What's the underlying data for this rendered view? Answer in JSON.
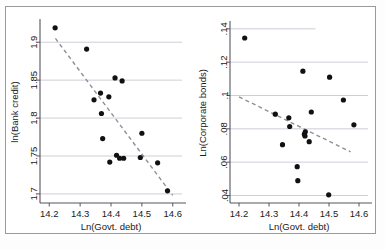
{
  "figure": {
    "background": "#ffffff",
    "frame_color": "#9a9a9a",
    "point_color": "#111111",
    "fitline_color": "#8f8f97",
    "grid_color": "#b9b9c6"
  },
  "chart_data": [
    {
      "type": "scatter",
      "title": "",
      "panel": "left",
      "xlabel": "Ln(Govt. debt)",
      "ylabel": "ln(Bank credit)",
      "xlim": [
        14.17,
        14.63
      ],
      "ylim": [
        1.688,
        1.928
      ],
      "xticks": [
        "14.2",
        "14.3",
        "14.4",
        "14.5",
        "14.6"
      ],
      "xtick_values": [
        14.2,
        14.3,
        14.4,
        14.5,
        14.6
      ],
      "yticks": [
        "1.9",
        "1.85",
        "1.8",
        "1.75",
        "1.7"
      ],
      "ytick_values": [
        1.9,
        1.85,
        1.8,
        1.75,
        1.7
      ],
      "grid": true,
      "legend": "none",
      "x": [
        14.219,
        14.321,
        14.345,
        14.366,
        14.369,
        14.373,
        14.393,
        14.396,
        14.413,
        14.418,
        14.428,
        14.436,
        14.441,
        14.495,
        14.5,
        14.551,
        14.583
      ],
      "y": [
        1.919,
        1.891,
        1.824,
        1.833,
        1.806,
        1.773,
        1.828,
        1.742,
        1.853,
        1.751,
        1.747,
        1.849,
        1.747,
        1.748,
        1.78,
        1.741,
        1.704
      ],
      "fit": {
        "x0": 14.22,
        "y0": 1.905,
        "x1": 14.6,
        "y1": 1.698,
        "style": "dashed"
      }
    },
    {
      "type": "scatter",
      "title": "",
      "panel": "right",
      "xlabel": "Ln(Govt. debt)",
      "ylabel": "Ln(Corporate bonds)",
      "xlim": [
        14.17,
        14.63
      ],
      "ylim": [
        0.0355,
        0.1435
      ],
      "xticks": [
        "14.2",
        "14.3",
        "14.4",
        "14.5",
        "14.6"
      ],
      "xtick_values": [
        14.2,
        14.3,
        14.4,
        14.5,
        14.6
      ],
      "yticks": [
        ".14",
        ".12",
        ".1",
        ".08",
        ".06",
        ".04"
      ],
      "ytick_values": [
        0.14,
        0.12,
        0.1,
        0.08,
        0.06,
        0.04
      ],
      "grid": true,
      "legend": "none",
      "x": [
        14.219,
        14.321,
        14.345,
        14.366,
        14.369,
        14.394,
        14.396,
        14.413,
        14.418,
        14.42,
        14.421,
        14.434,
        14.441,
        14.499,
        14.502,
        14.548,
        14.583
      ],
      "y": [
        0.1345,
        0.0888,
        0.0705,
        0.0866,
        0.0814,
        0.0573,
        0.0489,
        0.1146,
        0.0768,
        0.0757,
        0.0782,
        0.0723,
        0.0901,
        0.0404,
        0.111,
        0.0973,
        0.0824
      ],
      "fit": {
        "x0": 14.2,
        "y0": 0.0992,
        "x1": 14.572,
        "y1": 0.0662,
        "style": "dashed"
      }
    }
  ]
}
